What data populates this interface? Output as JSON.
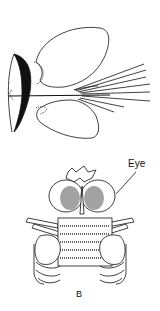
{
  "figure": {
    "top_drawing": "lateral view of larva with pleopods and setae",
    "bottom_drawing": "dorsal view of head and thorax",
    "labels": {
      "eye": "Eye",
      "panel": "B"
    },
    "colors": {
      "ink": "#111111",
      "background": "#ffffff"
    }
  }
}
